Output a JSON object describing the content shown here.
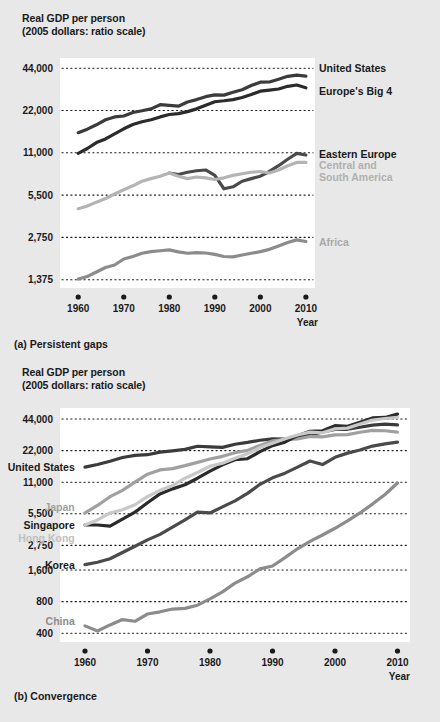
{
  "figure": {
    "background": "#e8e8e8",
    "plot_background": "#ffffff"
  },
  "panel_a": {
    "caption": "(a) Persistent gaps",
    "axis_title_line1": "Real GDP per person",
    "axis_title_line2": "(2005 dollars: ratio scale)",
    "xaxis_label": "Year",
    "chart_data": {
      "type": "line",
      "title": "Real GDP per person",
      "subtitle": "(2005 dollars: ratio scale)",
      "xlabel": "Year",
      "ylabel": "Real GDP per person (2005 dollars: ratio scale)",
      "scale": "log",
      "grid": true,
      "legend": "inline-right",
      "xlim": [
        1956,
        2012
      ],
      "ylim": [
        1200,
        52000
      ],
      "xticks": [
        1960,
        1970,
        1980,
        1990,
        2000,
        2010
      ],
      "yticks": [
        1375,
        2750,
        5500,
        11000,
        22000,
        44000
      ],
      "ytick_labels": [
        "1,375",
        "2,750",
        "5,500",
        "11,000",
        "22,000",
        "44,000"
      ],
      "series": [
        {
          "name": "United States",
          "color": "#3b3b3b",
          "label_color": "#1a1a1a",
          "label_x": 2012,
          "label_y": 44000,
          "x": [
            1960,
            1962,
            1964,
            1966,
            1968,
            1970,
            1972,
            1974,
            1976,
            1978,
            1980,
            1982,
            1984,
            1986,
            1988,
            1990,
            1992,
            1994,
            1996,
            1998,
            2000,
            2002,
            2004,
            2006,
            2008,
            2010
          ],
          "y": [
            15300,
            16200,
            17400,
            18900,
            19800,
            20100,
            21300,
            21900,
            22600,
            24200,
            23900,
            23600,
            25300,
            26300,
            27600,
            28400,
            28300,
            29700,
            30900,
            33100,
            35000,
            35100,
            36700,
            38500,
            39300,
            38600
          ]
        },
        {
          "name": "Europe's Big 4",
          "color": "#2b2b2b",
          "label_color": "#1a1a1a",
          "label_x": 2012,
          "label_y": 30500,
          "x": [
            1960,
            1962,
            1964,
            1966,
            1968,
            1970,
            1972,
            1974,
            1976,
            1978,
            1980,
            1982,
            1984,
            1986,
            1988,
            1990,
            1992,
            1994,
            1996,
            1998,
            2000,
            2002,
            2004,
            2006,
            2008,
            2010
          ],
          "y": [
            10900,
            11800,
            13000,
            13800,
            15000,
            16300,
            17500,
            18300,
            18900,
            19800,
            20600,
            20900,
            21600,
            22600,
            24000,
            25400,
            25800,
            26300,
            27200,
            28600,
            30200,
            30700,
            31300,
            32700,
            33400,
            31900
          ]
        },
        {
          "name": "Eastern Europe",
          "color": "#4a4a4a",
          "label_color": "#1a1a1a",
          "label_x": 2012,
          "label_y": 10800,
          "x": [
            1980,
            1982,
            1984,
            1986,
            1988,
            1990,
            1992,
            1994,
            1996,
            1998,
            2000,
            2002,
            2004,
            2006,
            2008,
            2010
          ],
          "y": [
            7900,
            7700,
            8000,
            8200,
            8300,
            7600,
            6100,
            6300,
            6900,
            7200,
            7500,
            8100,
            8900,
            9900,
            10900,
            10600
          ]
        },
        {
          "name": "Central and South America",
          "color": "#b4b4b4",
          "label_color": "#b0b0b0",
          "label_x": 2012,
          "label_y": 9000,
          "x": [
            1960,
            1962,
            1964,
            1966,
            1968,
            1970,
            1972,
            1974,
            1976,
            1978,
            1980,
            1982,
            1984,
            1986,
            1988,
            1990,
            1992,
            1994,
            1996,
            1998,
            2000,
            2002,
            2004,
            2006,
            2008,
            2010
          ],
          "y": [
            4400,
            4600,
            4900,
            5200,
            5600,
            6000,
            6400,
            6900,
            7200,
            7500,
            7900,
            7500,
            7200,
            7400,
            7300,
            7100,
            7300,
            7600,
            7800,
            8000,
            8100,
            7900,
            8300,
            8900,
            9400,
            9400
          ]
        },
        {
          "name": "Africa",
          "color": "#8c8c8c",
          "label_color": "#a8a8a8",
          "label_x": 2012,
          "label_y": 2550,
          "x": [
            1960,
            1962,
            1964,
            1966,
            1968,
            1970,
            1972,
            1974,
            1976,
            1978,
            1980,
            1982,
            1984,
            1986,
            1988,
            1990,
            1992,
            1994,
            1996,
            1998,
            2000,
            2002,
            2004,
            2006,
            2008,
            2010
          ],
          "y": [
            1390,
            1450,
            1560,
            1680,
            1750,
            1930,
            2010,
            2120,
            2180,
            2210,
            2240,
            2170,
            2120,
            2140,
            2130,
            2080,
            2010,
            2000,
            2060,
            2120,
            2180,
            2260,
            2390,
            2530,
            2640,
            2570
          ]
        }
      ]
    }
  },
  "panel_b": {
    "caption": "(b) Convergence",
    "axis_title_line1": "Real GDP per person",
    "axis_title_line2": "(2005 dollars: ratio scale)",
    "xaxis_label": "Year",
    "chart_data": {
      "type": "line",
      "title": "Real GDP per person",
      "subtitle": "(2005 dollars: ratio scale)",
      "xlabel": "Year",
      "ylabel": "Real GDP per person (2005 dollars: ratio scale)",
      "scale": "log",
      "grid": true,
      "legend": "inline-left",
      "xlim": [
        1956,
        2012
      ],
      "ylim": [
        330,
        56000
      ],
      "xticks": [
        1960,
        1970,
        1980,
        1990,
        2000,
        2010
      ],
      "yticks": [
        400,
        800,
        1600,
        2750,
        5500,
        11000,
        22000,
        44000
      ],
      "ytick_labels": [
        "400",
        "800",
        "1,600",
        "2,750",
        "5,500",
        "11,000",
        "22,000",
        "44,000"
      ],
      "series": [
        {
          "name": "United States",
          "color": "#3b3b3b",
          "label_color": "#1a1a1a",
          "label_x": 1959,
          "label_y": 15300,
          "label_anchor": "end",
          "x": [
            1960,
            1962,
            1964,
            1966,
            1968,
            1970,
            1972,
            1974,
            1976,
            1978,
            1980,
            1982,
            1984,
            1986,
            1988,
            1990,
            1992,
            1994,
            1996,
            1998,
            2000,
            2002,
            2004,
            2006,
            2008,
            2010
          ],
          "y": [
            15300,
            16200,
            17400,
            18900,
            19800,
            20100,
            21300,
            21900,
            22600,
            24200,
            23900,
            23600,
            25300,
            26300,
            27600,
            28400,
            28300,
            29700,
            30900,
            33100,
            35000,
            35100,
            36700,
            38500,
            39300,
            38600
          ]
        },
        {
          "name": "Japan",
          "color": "#a0a0a0",
          "label_color": "#a0a0a0",
          "label_x": 1959,
          "label_y": 6400,
          "label_anchor": "end",
          "x": [
            1960,
            1962,
            1964,
            1966,
            1968,
            1970,
            1972,
            1974,
            1976,
            1978,
            1980,
            1982,
            1984,
            1986,
            1988,
            1990,
            1992,
            1994,
            1996,
            1998,
            2000,
            2002,
            2004,
            2006,
            2008,
            2010
          ],
          "y": [
            5600,
            6600,
            8000,
            9200,
            11000,
            13100,
            14400,
            14800,
            15800,
            17000,
            18300,
            19400,
            21000,
            22100,
            24600,
            27200,
            28000,
            28400,
            30000,
            29700,
            31000,
            31200,
            32900,
            34300,
            34000,
            33000
          ]
        },
        {
          "name": "Singapore",
          "color": "#2b2b2b",
          "label_color": "#1a1a1a",
          "label_x": 1959,
          "label_y": 4300,
          "label_anchor": "end",
          "x": [
            1960,
            1962,
            1964,
            1966,
            1968,
            1970,
            1972,
            1974,
            1976,
            1978,
            1980,
            1982,
            1984,
            1986,
            1988,
            1990,
            1992,
            1994,
            1996,
            1998,
            2000,
            2002,
            2004,
            2006,
            2008,
            2010
          ],
          "y": [
            4300,
            4300,
            4200,
            4900,
            5700,
            7000,
            8500,
            9500,
            10400,
            12000,
            14000,
            16100,
            18000,
            18400,
            21500,
            24500,
            26500,
            30500,
            33600,
            34000,
            38000,
            37500,
            41000,
            45000,
            45500,
            49000
          ]
        },
        {
          "name": "Hong Kong",
          "color": "#c8c8c8",
          "label_color": "#c0c0c0",
          "label_x": 1959,
          "label_y": 3250,
          "label_anchor": "end",
          "x": [
            1960,
            1962,
            1964,
            1966,
            1968,
            1970,
            1972,
            1974,
            1976,
            1978,
            1980,
            1982,
            1984,
            1986,
            1988,
            1990,
            1992,
            1994,
            1996,
            1998,
            2000,
            2002,
            2004,
            2006,
            2008,
            2010
          ],
          "y": [
            4300,
            4800,
            5600,
            6000,
            6700,
            8000,
            9200,
            10200,
            12000,
            13600,
            15600,
            16700,
            18600,
            20500,
            23500,
            25800,
            28500,
            31000,
            33000,
            32500,
            35500,
            36000,
            39500,
            43000,
            44500,
            45500
          ]
        },
        {
          "name": "Korea",
          "color": "#4a4a4a",
          "label_color": "#1a1a1a",
          "label_x": 1959,
          "label_y": 1800,
          "label_anchor": "end",
          "x": [
            1960,
            1962,
            1964,
            1966,
            1968,
            1970,
            1972,
            1974,
            1976,
            1978,
            1980,
            1982,
            1984,
            1986,
            1988,
            1990,
            1992,
            1994,
            1996,
            1998,
            2000,
            2002,
            2004,
            2006,
            2008,
            2010
          ],
          "y": [
            1800,
            1900,
            2050,
            2350,
            2700,
            3100,
            3500,
            4100,
            4800,
            5700,
            5600,
            6400,
            7300,
            8600,
            10500,
            12100,
            13400,
            15300,
            17500,
            16200,
            19000,
            20800,
            22300,
            24300,
            25500,
            26500
          ]
        },
        {
          "name": "China",
          "color": "#8c8c8c",
          "label_color": "#8c8c8c",
          "label_x": 1959,
          "label_y": 520,
          "label_anchor": "end",
          "x": [
            1960,
            1962,
            1964,
            1966,
            1968,
            1970,
            1972,
            1974,
            1976,
            1978,
            1980,
            1982,
            1984,
            1986,
            1988,
            1990,
            1992,
            1994,
            1996,
            1998,
            2000,
            2002,
            2004,
            2006,
            2008,
            2010
          ],
          "y": [
            470,
            420,
            480,
            540,
            520,
            610,
            640,
            680,
            690,
            740,
            850,
            990,
            1200,
            1380,
            1640,
            1750,
            2100,
            2550,
            3000,
            3450,
            4000,
            4700,
            5600,
            6800,
            8400,
            10800
          ]
        }
      ]
    }
  }
}
